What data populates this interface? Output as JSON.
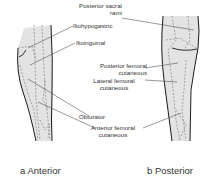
{
  "figure": {
    "panels": [
      {
        "id": "a",
        "caption": "a Anterior"
      },
      {
        "id": "b",
        "caption": "b Posterior"
      }
    ],
    "labels": {
      "posterior_sacral_1": "Posterior sacral",
      "posterior_sacral_2": "rami",
      "iliohypogastric": "Iliohypogastric",
      "ilioinguinal": "Ilioinguinal",
      "posterior_femoral_1": "Posterior femoral",
      "posterior_femoral_2": "cutaneous",
      "lateral_femoral_1": "Lateral femoral",
      "lateral_femoral_2": "cutaneous",
      "obturator": "Obturator",
      "anterior_femoral_1": "Anterior femoral",
      "anterior_femoral_2": "cutaneous"
    },
    "colors": {
      "leg_fill": "#e3e3e3",
      "outline": "#1a1a1a",
      "dashed": "#777777",
      "leader": "#555555"
    }
  }
}
